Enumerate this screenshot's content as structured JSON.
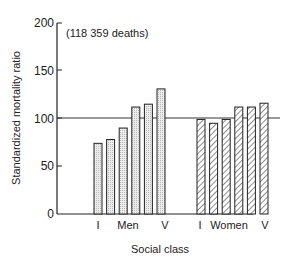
{
  "chart_data": {
    "type": "bar",
    "title": "",
    "annotation": "(118 359 deaths)",
    "xlabel": "Social class",
    "ylabel": "Standardized mortality ratio",
    "ylim": [
      0,
      200
    ],
    "yticks": [
      0,
      50,
      100,
      150,
      200
    ],
    "reference_line": 100,
    "grid": false,
    "legend": null,
    "groups": [
      {
        "name": "Men",
        "categories": [
          "I",
          "II",
          "IIIN",
          "IIIM",
          "IV",
          "V"
        ],
        "tick_labels": [
          "I",
          "",
          "Men",
          "",
          "",
          "V"
        ],
        "values": [
          74,
          78,
          90,
          112,
          115,
          131
        ],
        "fill": "dotted"
      },
      {
        "name": "Women",
        "categories": [
          "I",
          "II",
          "IIIN",
          "IIIM",
          "IV",
          "V"
        ],
        "tick_labels": [
          "I",
          "",
          "Women",
          "",
          "",
          "V"
        ],
        "values": [
          99,
          95,
          99,
          112,
          112,
          116
        ],
        "fill": "hatched"
      }
    ]
  },
  "labels": {
    "annotation": "(118 359 deaths)",
    "xlabel": "Social class",
    "ylabel": "Standardized mortality ratio",
    "men_I": "I",
    "men": "Men",
    "men_V": "V",
    "women_I": "I",
    "women": "Women",
    "women_V": "V",
    "y0": "0",
    "y50": "50",
    "y100": "100",
    "y150": "150",
    "y200": "200"
  }
}
